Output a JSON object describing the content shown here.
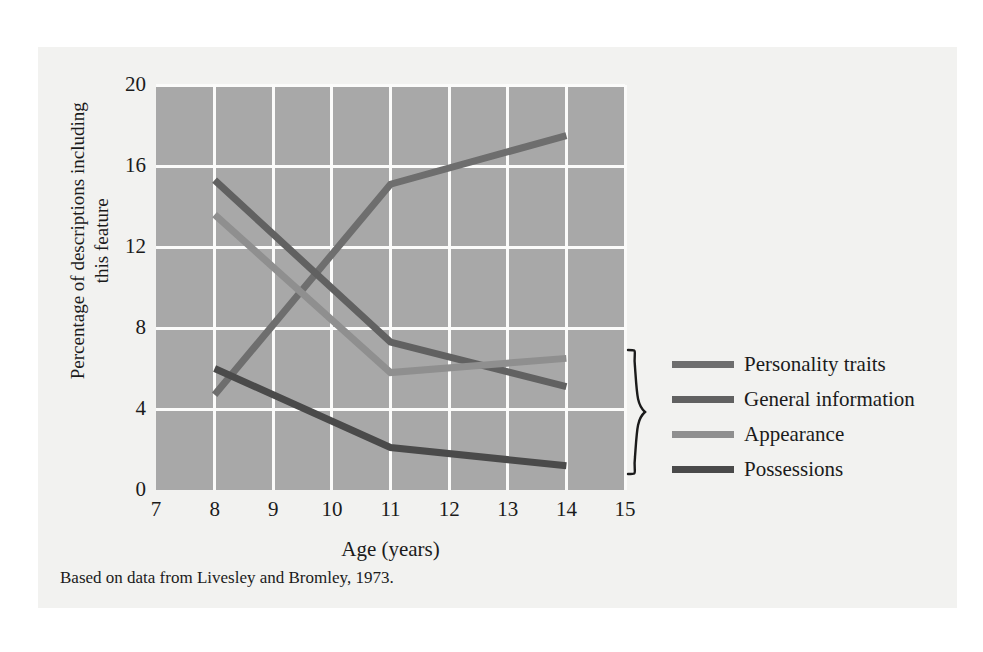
{
  "figure": {
    "caption": "Based on data from Livesley and Bromley, 1973.",
    "background": "#f2f2f0",
    "plot_background": "#a8a8a8",
    "gridline_color": "#fbfbfa"
  },
  "legend": {
    "position": "right",
    "items": [
      {
        "label": "Personality traits",
        "color": "#6e6e6e"
      },
      {
        "label": "General information",
        "color": "#616161"
      },
      {
        "label": "Appearance",
        "color": "#8f8f8f"
      },
      {
        "label": "Possessions",
        "color": "#4a4a4a"
      }
    ]
  },
  "chart_data": {
    "type": "line",
    "title": "",
    "subtitle": "",
    "xlabel": "Age (years)",
    "ylabel": "Percentage of descriptions including this feature",
    "xlim": [
      7,
      15
    ],
    "ylim": [
      0,
      20
    ],
    "xticks": [
      7,
      8,
      9,
      10,
      11,
      12,
      13,
      14,
      15
    ],
    "yticks": [
      0,
      4,
      8,
      12,
      16,
      20
    ],
    "grid": true,
    "x": [
      8,
      11,
      14
    ],
    "series": [
      {
        "name": "Personality traits",
        "color": "#6e6e6e",
        "values": [
          4.7,
          15.1,
          17.5
        ]
      },
      {
        "name": "General information",
        "color": "#616161",
        "values": [
          15.3,
          7.3,
          5.1
        ]
      },
      {
        "name": "Appearance",
        "color": "#8f8f8f",
        "values": [
          13.6,
          5.8,
          6.5
        ]
      },
      {
        "name": "Possessions",
        "color": "#4a4a4a",
        "values": [
          6.0,
          2.1,
          1.2
        ]
      }
    ],
    "annotations": [
      {
        "type": "brace",
        "label": "",
        "x": 14.4,
        "y_from": 6.7,
        "y_to": 0.8
      }
    ]
  }
}
